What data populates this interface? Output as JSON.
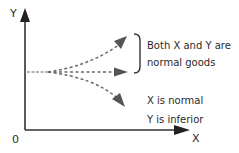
{
  "diagram": {
    "axes": {
      "y_label": "Y",
      "x_label": "X",
      "origin_label": "0"
    },
    "annotations": {
      "normal_goods_line1": "Both X and Y are",
      "normal_goods_line2": "normal goods",
      "inferior_line1": "X is normal",
      "inferior_line2": "Y is inferior"
    },
    "colors": {
      "axis": "#333333",
      "dashed": "#6a6a6a",
      "text": "#2a2a2a"
    }
  }
}
